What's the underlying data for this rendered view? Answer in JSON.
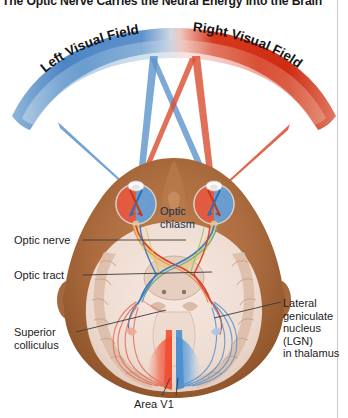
{
  "figure": {
    "title": "The Optic Nerve Carries the Neural Energy into the Brain",
    "type": "anatomical-diagram"
  },
  "visual_fields": {
    "left": {
      "label": "Left Visual Field",
      "color": "#3d7cc0"
    },
    "right": {
      "label": "Right Visual Field",
      "color": "#d6341f"
    }
  },
  "labels": {
    "optic_nerve": "Optic nerve",
    "optic_tract": "Optic tract",
    "superior_colliculus": "Superior\ncolliculus",
    "optic_chiasm": "Optic\nchiasm",
    "lgn": "Lateral\ngeniculate\nnucleus\n(LGN)\nin thalamus",
    "area_v1": "Area V1"
  },
  "colors": {
    "left_field_blue": "#3d7cc0",
    "right_field_red": "#d6341f",
    "skin": "#a9693f",
    "skin_light": "#c98e5d",
    "brain_tissue": "#efdcd2",
    "cortex_band": "#d8b9a5",
    "v1_red": "#e8503a",
    "v1_blue": "#5b96d4",
    "label_text": "#1c1c1c",
    "leader_line": "#3a3a3a",
    "frame": "#c9c9c9"
  },
  "pathway_traces": {
    "red_pathway": "right visual field -> left nasal retina + right temporal retina -> optic chiasm -> left optic tract -> left LGN -> left V1",
    "blue_pathway": "left visual field -> right nasal retina + left temporal retina -> optic chiasm -> right optic tract -> right LGN -> right V1"
  }
}
